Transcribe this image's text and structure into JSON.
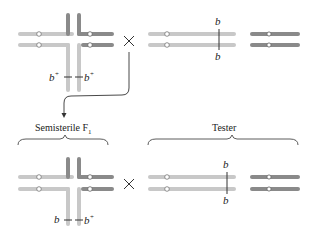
{
  "colors": {
    "light_chrom": "#c8c8c8",
    "dark_chrom": "#8a8a8a",
    "line": "#333333",
    "text": "#222222"
  },
  "top_row": {
    "left": {
      "description": "translocation heterozygote cross figure",
      "gene_left": "b",
      "gene_left_sup": "+",
      "gene_right": "b",
      "gene_right_sup": "+"
    },
    "cross_symbol": "×",
    "right": {
      "description": "tester chromosomes",
      "gene_top": "b",
      "gene_bottom": "b"
    }
  },
  "labels": {
    "semisterile": "Semisterile F",
    "semisterile_sub": "1",
    "tester": "Tester"
  },
  "bottom_row": {
    "left": {
      "gene_left": "b",
      "gene_right": "b",
      "gene_right_sup": "+"
    },
    "cross_symbol": "×",
    "right": {
      "gene_top": "b",
      "gene_bottom": "b"
    }
  }
}
